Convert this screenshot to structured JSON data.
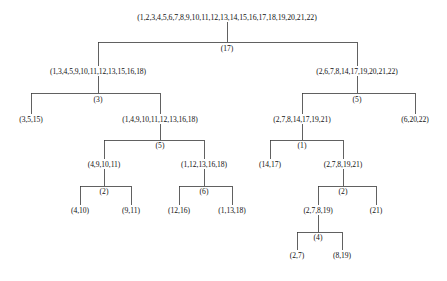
{
  "figure": {
    "kind": "dendrogram",
    "line_color": "#3a3a3a",
    "text_color": "#111111",
    "background": "#ffffff"
  },
  "nodes": [
    {
      "id": "n0",
      "label": "(1,2,3,4,5,6,7,8,9,10,11,12,13,14,15,16,17,18,19,20,21,22)",
      "x": 227,
      "y": 18
    },
    {
      "id": "n1",
      "label": "(1,3,4,5,9,10,11,12,13,15,16,18)",
      "x": 98,
      "y": 72
    },
    {
      "id": "n2",
      "label": "(2,6,7,8,14,17,19,20,21,22)",
      "x": 357,
      "y": 72
    },
    {
      "id": "n3",
      "label": "(3,5,15)",
      "x": 31,
      "y": 120
    },
    {
      "id": "n4",
      "label": "(1,4,9,10,11,12,13,16,18)",
      "x": 160,
      "y": 120
    },
    {
      "id": "n5",
      "label": "(2,7,8,14,17,19,21)",
      "x": 302,
      "y": 120
    },
    {
      "id": "n6",
      "label": "(6,20,22)",
      "x": 415,
      "y": 120
    },
    {
      "id": "n7",
      "label": "(4,9,10,11)",
      "x": 104,
      "y": 165
    },
    {
      "id": "n8",
      "label": "(1,12,13,16,18)",
      "x": 204,
      "y": 165
    },
    {
      "id": "n9",
      "label": "(14,17)",
      "x": 270,
      "y": 165
    },
    {
      "id": "n10",
      "label": "(2,7,8,19,21)",
      "x": 343,
      "y": 165
    },
    {
      "id": "n11",
      "label": "(4,10)",
      "x": 80,
      "y": 211
    },
    {
      "id": "n12",
      "label": "(9,11)",
      "x": 131,
      "y": 211
    },
    {
      "id": "n13",
      "label": "(12,16)",
      "x": 179,
      "y": 211
    },
    {
      "id": "n14",
      "label": "(1,13,18)",
      "x": 232,
      "y": 211
    },
    {
      "id": "n15",
      "label": "(2,7,8,19)",
      "x": 318,
      "y": 211
    },
    {
      "id": "n16",
      "label": "(21)",
      "x": 376,
      "y": 211
    },
    {
      "id": "n17",
      "label": "(2,7)",
      "x": 297,
      "y": 256
    },
    {
      "id": "n18",
      "label": "(8,19)",
      "x": 342,
      "y": 256
    }
  ],
  "merges": [
    {
      "id": "m0",
      "label": "(17)",
      "parent": "n0",
      "children": [
        "n1",
        "n2"
      ],
      "bar_y": 42,
      "label_x": 227,
      "label_y": 44
    },
    {
      "id": "m1",
      "label": "(3)",
      "parent": "n1",
      "children": [
        "n3",
        "n4"
      ],
      "bar_y": 93,
      "label_x": 98,
      "label_y": 95
    },
    {
      "id": "m2",
      "label": "(5)",
      "parent": "n2",
      "children": [
        "n5",
        "n6"
      ],
      "bar_y": 93,
      "label_x": 357,
      "label_y": 95
    },
    {
      "id": "m3",
      "label": "(5)",
      "parent": "n4",
      "children": [
        "n7",
        "n8"
      ],
      "bar_y": 140,
      "label_x": 160,
      "label_y": 141
    },
    {
      "id": "m4",
      "label": "(1)",
      "parent": "n5",
      "children": [
        "n9",
        "n10"
      ],
      "bar_y": 140,
      "label_x": 302,
      "label_y": 141
    },
    {
      "id": "m5",
      "label": "(2)",
      "parent": "n7",
      "children": [
        "n11",
        "n12"
      ],
      "bar_y": 186,
      "label_x": 104,
      "label_y": 187
    },
    {
      "id": "m6",
      "label": "(6)",
      "parent": "n8",
      "children": [
        "n13",
        "n14"
      ],
      "bar_y": 186,
      "label_x": 204,
      "label_y": 187
    },
    {
      "id": "m7",
      "label": "(2)",
      "parent": "n10",
      "children": [
        "n15",
        "n16"
      ],
      "bar_y": 186,
      "label_x": 343,
      "label_y": 187
    },
    {
      "id": "m8",
      "label": "(4)",
      "parent": "n15",
      "children": [
        "n17",
        "n18"
      ],
      "bar_y": 232,
      "label_x": 318,
      "label_y": 233
    }
  ]
}
